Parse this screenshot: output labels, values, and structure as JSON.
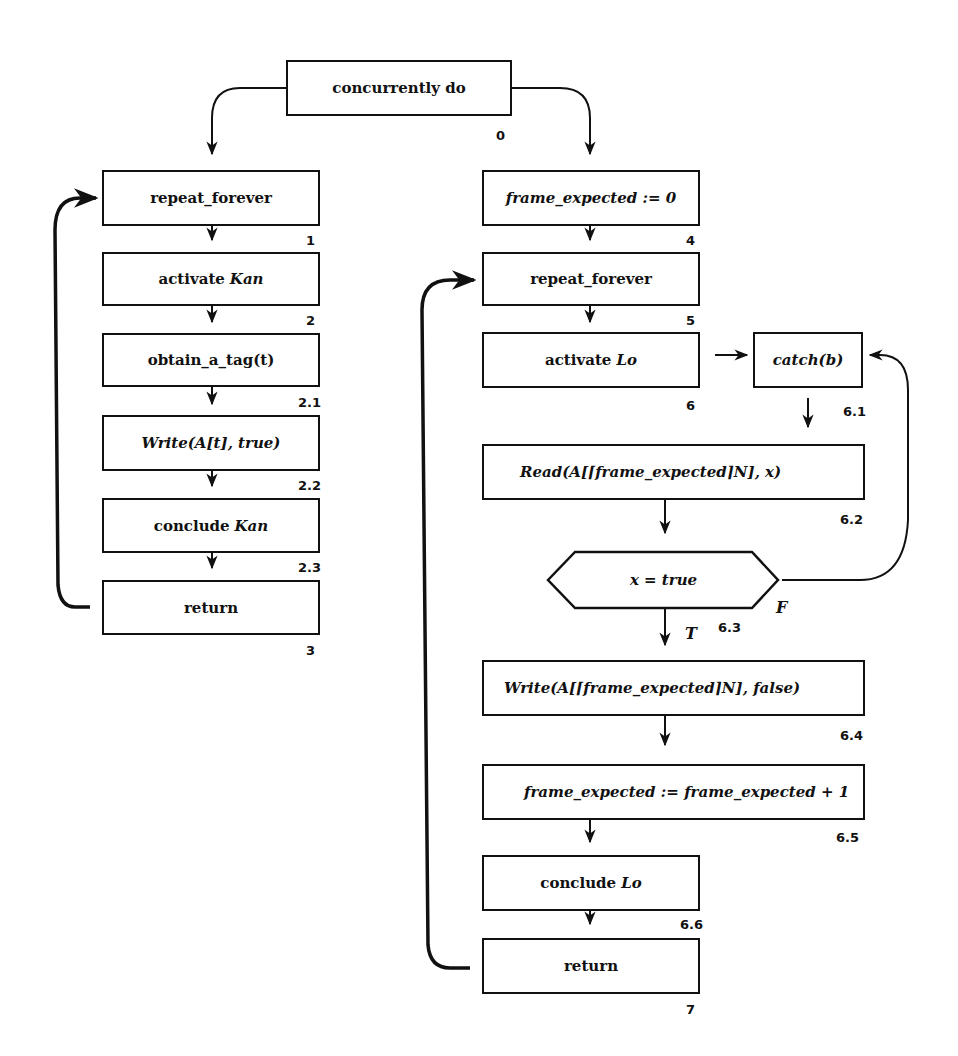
{
  "diagram": {
    "type": "flowchart",
    "root": {
      "label": "concurrently do",
      "number": "0"
    },
    "left_branch": [
      {
        "id": "n1",
        "label": "repeat_forever",
        "number": "1"
      },
      {
        "id": "n2",
        "prefix": "activate ",
        "var": "Kan",
        "number": "2"
      },
      {
        "id": "n2_1",
        "label": "obtain_a_tag(t)",
        "number": "2.1"
      },
      {
        "id": "n2_2",
        "label": "Write(A[t], true)",
        "number": "2.2"
      },
      {
        "id": "n2_3",
        "prefix": "conclude ",
        "var": "Kan",
        "number": "2.3"
      },
      {
        "id": "n3",
        "label": "return",
        "number": "3"
      }
    ],
    "right_branch": [
      {
        "id": "n4",
        "label": "frame_expected := 0",
        "number": "4"
      },
      {
        "id": "n5",
        "label": "repeat_forever",
        "number": "5"
      },
      {
        "id": "n6",
        "prefix": "activate ",
        "var": "Lo",
        "number": "6"
      },
      {
        "id": "n6_1",
        "label": "catch(b)",
        "number": "6.1"
      },
      {
        "id": "n6_2",
        "label": "Read(A[⌈frame_expected⌉N], x)",
        "number": "6.2"
      },
      {
        "id": "n6_3",
        "label": "x = true",
        "number": "6.3",
        "shape": "hexagon",
        "true_label": "T",
        "false_label": "F"
      },
      {
        "id": "n6_4",
        "label": "Write(A[⌈frame_expected⌉N], false)",
        "number": "6.4"
      },
      {
        "id": "n6_5",
        "label": "frame_expected := frame_expected + 1",
        "number": "6.5"
      },
      {
        "id": "n6_6",
        "prefix": "conclude ",
        "var": "Lo",
        "number": "6.6"
      },
      {
        "id": "n7",
        "label": "return",
        "number": "7"
      }
    ],
    "edges": [
      [
        "n0",
        "n1"
      ],
      [
        "n0",
        "n4"
      ],
      [
        "n1",
        "n2"
      ],
      [
        "n2",
        "n2_1"
      ],
      [
        "n2_1",
        "n2_2"
      ],
      [
        "n2_2",
        "n2_3"
      ],
      [
        "n2_3",
        "n3"
      ],
      [
        "n3",
        "n1"
      ],
      [
        "n4",
        "n5"
      ],
      [
        "n5",
        "n6"
      ],
      [
        "n6",
        "n6_1"
      ],
      [
        "n6_1",
        "n6_2"
      ],
      [
        "n6_2",
        "n6_3"
      ],
      [
        "n6_3",
        "n6_4",
        "T"
      ],
      [
        "n6_3",
        "n6_1",
        "F"
      ],
      [
        "n6_4",
        "n6_5"
      ],
      [
        "n6_5",
        "n6_6"
      ],
      [
        "n6_6",
        "n7"
      ],
      [
        "n7",
        "n5"
      ]
    ]
  }
}
